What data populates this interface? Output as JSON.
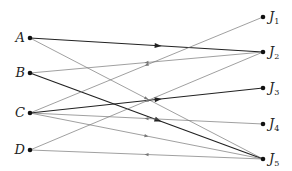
{
  "diagram": {
    "type": "bipartite-directed-graph",
    "left_nodes": [
      {
        "id": "A",
        "label": "A",
        "x": 30,
        "y": 38
      },
      {
        "id": "B",
        "label": "B",
        "x": 30,
        "y": 73
      },
      {
        "id": "C",
        "label": "C",
        "x": 30,
        "y": 113
      },
      {
        "id": "D",
        "label": "D",
        "x": 30,
        "y": 150
      }
    ],
    "right_nodes": [
      {
        "id": "J1",
        "label": "J",
        "sub": "1",
        "x": 263,
        "y": 17
      },
      {
        "id": "J2",
        "label": "J",
        "sub": "2",
        "x": 263,
        "y": 52
      },
      {
        "id": "J3",
        "label": "J",
        "sub": "3",
        "x": 263,
        "y": 88
      },
      {
        "id": "J4",
        "label": "J",
        "sub": "4",
        "x": 263,
        "y": 124
      },
      {
        "id": "J5",
        "label": "J",
        "sub": "5",
        "x": 263,
        "y": 159
      }
    ],
    "edges": [
      {
        "from": "A",
        "to": "J2",
        "weight": "thick",
        "arrow": "forward"
      },
      {
        "from": "A",
        "to": "J5",
        "weight": "thin",
        "arrow": "forward"
      },
      {
        "from": "B",
        "to": "J2",
        "weight": "thin",
        "arrow": "backward"
      },
      {
        "from": "B",
        "to": "J5",
        "weight": "thick",
        "arrow": "forward"
      },
      {
        "from": "C",
        "to": "J1",
        "weight": "thin",
        "arrow": "backward"
      },
      {
        "from": "C",
        "to": "J3",
        "weight": "thick",
        "arrow": "forward"
      },
      {
        "from": "C",
        "to": "J4",
        "weight": "thin",
        "arrow": "backward"
      },
      {
        "from": "C",
        "to": "J5",
        "weight": "thin",
        "arrow": "forward"
      },
      {
        "from": "D",
        "to": "J2",
        "weight": "thin",
        "arrow": "backward"
      },
      {
        "from": "D",
        "to": "J5",
        "weight": "thin",
        "arrow": "backward"
      }
    ],
    "colors": {
      "thick": "#222222",
      "thin": "#777777",
      "node": "#111111"
    }
  }
}
